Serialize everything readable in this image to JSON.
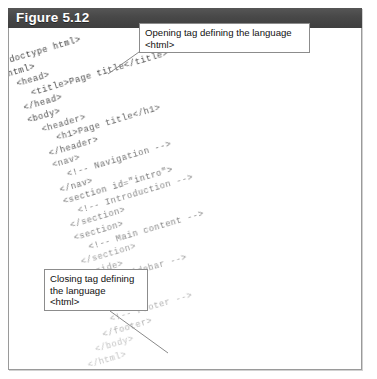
{
  "figure": {
    "label": "Figure 5.12",
    "header_bg": "#4a4a4a",
    "frame_border": "#9a9a9a"
  },
  "callouts": {
    "opening": {
      "name": "opening-tag-callout",
      "line1": "Opening tag defining the language",
      "line2": "<html>"
    },
    "closing": {
      "name": "closing-tag-callout",
      "line1": "Closing tag defining",
      "line2": "the language",
      "line3": "<html>"
    }
  },
  "code": {
    "language": "html",
    "rotation_degrees": -16.5,
    "lines": [
      "<!doctype html>",
      "<html>",
      "  <head>",
      "    <title>Page title</title>",
      "  </head>",
      "  <body>",
      "    <header>",
      "      <h1>Page title</h1>",
      "    </header>",
      "    <nav>",
      "      <!-- Navigation -->",
      "    </nav>",
      "    <section id=\"intro\">",
      "      <!-- Introduction -->",
      "    </section>",
      "    <section>",
      "      <!-- Main content -->",
      "    </section>",
      "    <aside>",
      "      <!-- Sidebar -->",
      "    </aside>",
      "    <footer>",
      "      <!-- Footer -->",
      "    </footer>",
      "  </body>",
      "</html>"
    ]
  }
}
